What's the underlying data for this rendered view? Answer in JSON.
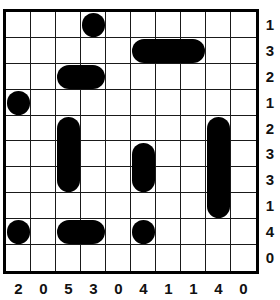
{
  "puzzle": {
    "type": "battleships",
    "grid_size": {
      "rows": 10,
      "cols": 10
    },
    "row_clues": [
      1,
      3,
      2,
      1,
      2,
      3,
      3,
      1,
      4,
      0
    ],
    "col_clues": [
      2,
      0,
      5,
      3,
      0,
      4,
      1,
      1,
      4,
      0
    ],
    "ships": [
      {
        "row": 0,
        "col": 3,
        "length": 1,
        "orientation": "single"
      },
      {
        "row": 1,
        "col": 5,
        "length": 3,
        "orientation": "horizontal"
      },
      {
        "row": 2,
        "col": 2,
        "length": 2,
        "orientation": "horizontal"
      },
      {
        "row": 3,
        "col": 0,
        "length": 1,
        "orientation": "single"
      },
      {
        "row": 4,
        "col": 2,
        "length": 3,
        "orientation": "vertical"
      },
      {
        "row": 4,
        "col": 8,
        "length": 4,
        "orientation": "vertical"
      },
      {
        "row": 5,
        "col": 5,
        "length": 2,
        "orientation": "vertical"
      },
      {
        "row": 8,
        "col": 0,
        "length": 1,
        "orientation": "single"
      },
      {
        "row": 8,
        "col": 2,
        "length": 2,
        "orientation": "horizontal"
      },
      {
        "row": 8,
        "col": 5,
        "length": 1,
        "orientation": "single"
      }
    ],
    "colors": {
      "ship": "#000000",
      "grid_line": "#1a1a1a",
      "background": "#ffffff"
    }
  }
}
